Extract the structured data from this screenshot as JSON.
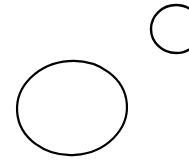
{
  "canvas": {
    "width": 189,
    "height": 168,
    "background": "#ffffff"
  },
  "shapes": [
    {
      "name": "large-ellipse",
      "type": "ellipse",
      "cx": 72,
      "cy": 108,
      "rx": 55,
      "ry": 47,
      "stroke": "#000000",
      "stroke_width": 2.2,
      "fill": "none",
      "rotation": -4
    },
    {
      "name": "small-circle",
      "type": "ellipse",
      "cx": 176,
      "cy": 29,
      "rx": 25,
      "ry": 24,
      "stroke": "#000000",
      "stroke_width": 2.4,
      "fill": "none",
      "rotation": 0
    }
  ]
}
